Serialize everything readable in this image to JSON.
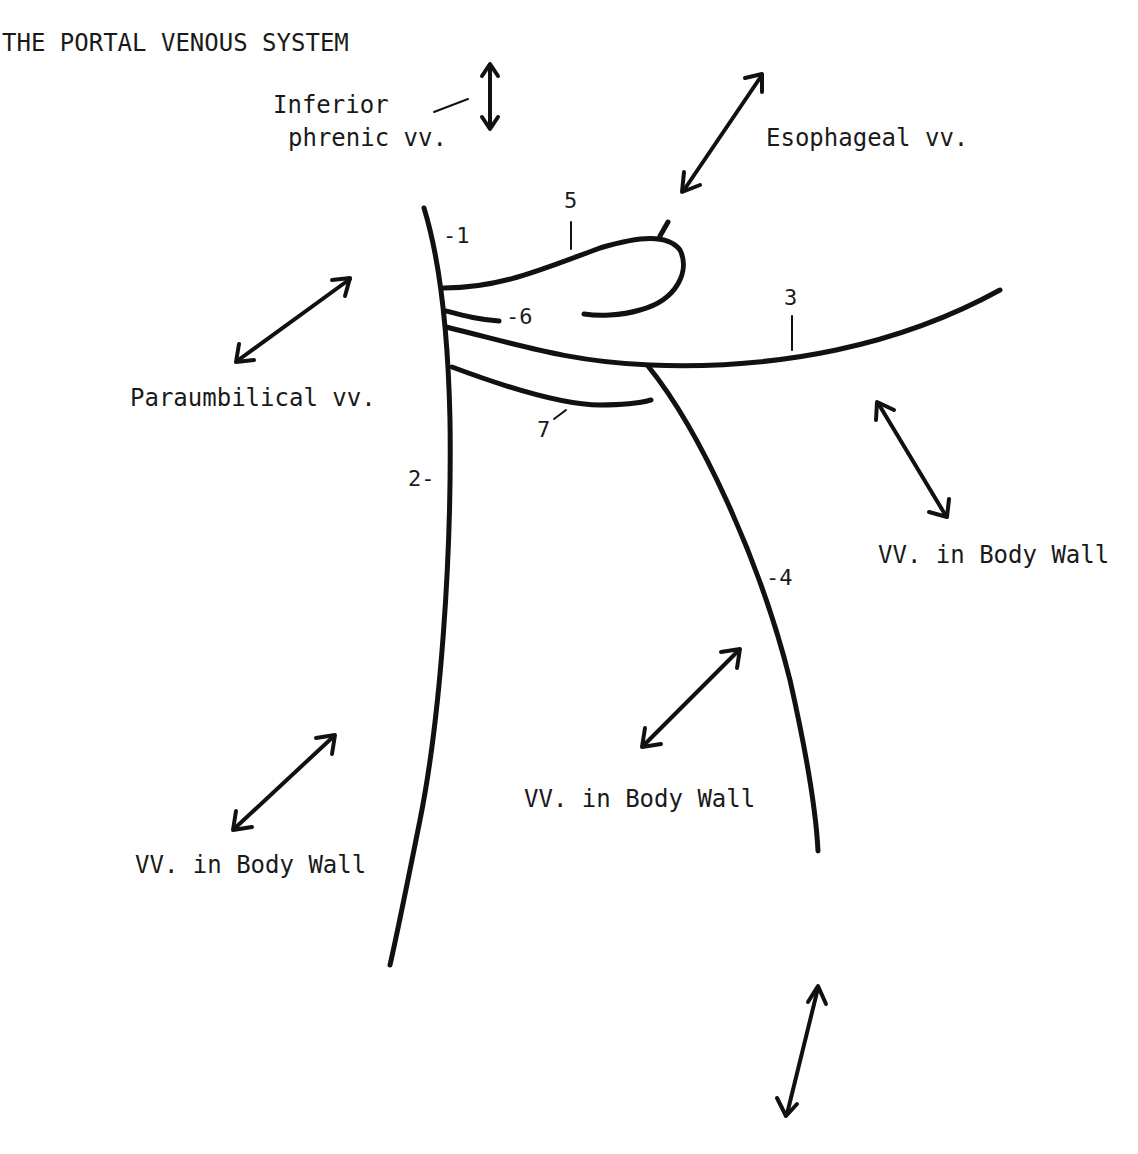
{
  "title": "THE PORTAL VENOUS SYSTEM",
  "labels": {
    "inferior_phrenic_1": "Inferior",
    "inferior_phrenic_2": "phrenic vv.",
    "esophageal": "Esophageal vv.",
    "paraumbilical": "Paraumbilical vv.",
    "body_wall_right": "VV. in Body Wall",
    "body_wall_center": "VV. in Body Wall",
    "body_wall_left": "VV. in Body Wall"
  },
  "numbers": {
    "n1": "-1",
    "n2": "2-",
    "n3": "3",
    "n4": "-4",
    "n5": "5",
    "n6": "-6",
    "n7": "7"
  },
  "colors": {
    "ink": "#111111",
    "background": "#ffffff"
  }
}
